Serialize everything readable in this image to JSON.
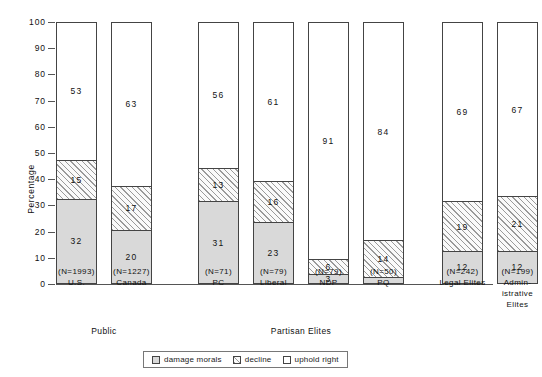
{
  "chart_data": {
    "type": "bar",
    "subtype": "stacked-vertical-100",
    "title": "",
    "xlabel": "",
    "ylabel": "Percentage",
    "ylim": [
      0,
      100
    ],
    "yticks": [
      0,
      10,
      20,
      30,
      40,
      50,
      60,
      70,
      80,
      90,
      100
    ],
    "grid": false,
    "legend_position": "bottom-center",
    "categories": [
      "U.S.",
      "Canada",
      "PC",
      "Liberal",
      "NDP",
      "PQ",
      "Legal Elites",
      "Administrative Elites"
    ],
    "category_sample_sizes": [
      "(N=1993)",
      "(N=1227)",
      "(N=71)",
      "(N=79)",
      "(N=79)",
      "(N=50)",
      "(N=242)",
      "(N=199)"
    ],
    "series": [
      {
        "name": "damage morals",
        "fill": "dotted",
        "values": [
          32,
          20,
          31,
          23,
          3,
          2,
          12,
          12
        ]
      },
      {
        "name": "decline",
        "fill": "hatched",
        "values": [
          15,
          17,
          13,
          16,
          6,
          14,
          19,
          21
        ]
      },
      {
        "name": "uphold right",
        "fill": "white",
        "values": [
          53,
          63,
          56,
          61,
          91,
          84,
          69,
          67
        ]
      }
    ],
    "groups": [
      {
        "label": "Public",
        "members": [
          "U.S.",
          "Canada"
        ]
      },
      {
        "label": "Partisan Elites",
        "members": [
          "PC",
          "Liberal",
          "NDP",
          "PQ"
        ]
      }
    ]
  },
  "bars": [
    {
      "name": "U.S.",
      "n": "(N=1993)",
      "label_lines": [
        "U.S."
      ],
      "damage_morals": 32,
      "decline": 15,
      "uphold_right": 53
    },
    {
      "name": "Canada",
      "n": "(N=1227)",
      "label_lines": [
        "Canada"
      ],
      "damage_morals": 20,
      "decline": 17,
      "uphold_right": 63
    },
    {
      "name": "PC",
      "n": "(N=71)",
      "label_lines": [
        "PC"
      ],
      "damage_morals": 31,
      "decline": 13,
      "uphold_right": 56
    },
    {
      "name": "Liberal",
      "n": "(N=79)",
      "label_lines": [
        "Liberal"
      ],
      "damage_morals": 23,
      "decline": 16,
      "uphold_right": 61
    },
    {
      "name": "NDP",
      "n": "(N=79)",
      "label_lines": [
        "NDP"
      ],
      "damage_morals": 3,
      "decline": 6,
      "uphold_right": 91
    },
    {
      "name": "PQ",
      "n": "(N=50)",
      "label_lines": [
        "PQ"
      ],
      "damage_morals": 2,
      "decline": 14,
      "uphold_right": 84
    },
    {
      "name": "Legal Elites",
      "n": "(N=242)",
      "label_lines": [
        "Legal Elites"
      ],
      "damage_morals": 12,
      "decline": 19,
      "uphold_right": 69
    },
    {
      "name": "Administrative Elites",
      "n": "(N=199)",
      "label_lines": [
        "Admin-",
        "istrative",
        "Elites"
      ],
      "damage_morals": 12,
      "decline": 21,
      "uphold_right": 67
    }
  ],
  "axis": {
    "y_title": "Percentage",
    "y_tick_labels": [
      "0",
      "10",
      "20",
      "30",
      "40",
      "50",
      "60",
      "70",
      "80",
      "90",
      "100"
    ]
  },
  "cluster_labels": [
    {
      "text": "Public"
    },
    {
      "text": "Partisan Elites"
    }
  ],
  "legend": {
    "items": [
      {
        "label": "damage morals",
        "fill": "dotted"
      },
      {
        "label": "decline",
        "fill": "hatched"
      },
      {
        "label": "uphold right",
        "fill": "white"
      }
    ]
  },
  "colors": {
    "axis": "#555555",
    "bar_outline": "#444444",
    "damage_morals": "#d9d9d9",
    "decline": "#fafafa",
    "uphold_right": "#ffffff",
    "text": "#111111"
  }
}
